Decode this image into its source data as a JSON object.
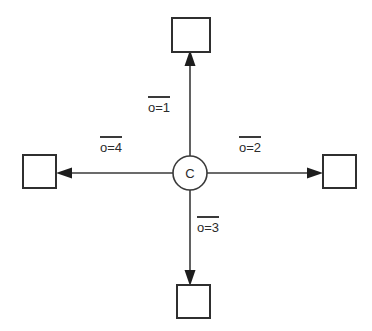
{
  "diagram": {
    "type": "star-topology",
    "background_color": "#ffffff",
    "stroke_color": "#3a3a3a",
    "text_color": "#2b2b2b",
    "center_node": {
      "label": "C",
      "shape": "circle",
      "cx": 190,
      "cy": 173,
      "r": 17
    },
    "leaf_nodes": [
      {
        "name": "top-node",
        "shape": "square",
        "x": 172,
        "y": 18,
        "size": 38
      },
      {
        "name": "right-node",
        "shape": "square",
        "x": 323,
        "y": 155,
        "size": 33
      },
      {
        "name": "bottom-node",
        "shape": "square",
        "x": 177,
        "y": 285,
        "size": 33
      },
      {
        "name": "left-node",
        "shape": "square",
        "x": 23,
        "y": 155,
        "size": 33
      }
    ],
    "edges": [
      {
        "name": "edge-up",
        "direction": "up",
        "label": "o=1",
        "overline": true,
        "label_x": 148,
        "label_y": 96
      },
      {
        "name": "edge-right",
        "direction": "right",
        "label": "o=2",
        "overline": true,
        "label_x": 239,
        "label_y": 136
      },
      {
        "name": "edge-down",
        "direction": "down",
        "label": "o=3",
        "overline": true,
        "label_x": 197,
        "label_y": 216
      },
      {
        "name": "edge-left",
        "direction": "left",
        "label": "o=4",
        "overline": true,
        "label_x": 100,
        "label_y": 136
      }
    ]
  }
}
